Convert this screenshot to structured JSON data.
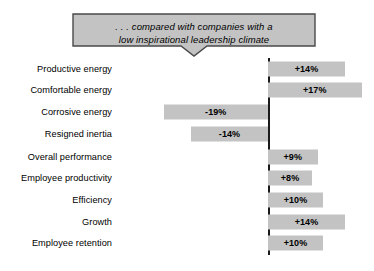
{
  "banner": {
    "line1": ". . . compared with companies with a",
    "line2": "low inspirational leadership climate"
  },
  "colors": {
    "bar_fill": "#c3c3c3",
    "banner_fill": "#c3c3c3",
    "banner_stroke": "#4a4a4a",
    "axis": "#1a1a1a",
    "text": "#000000",
    "background": "#ffffff"
  },
  "chart_data": {
    "type": "bar",
    "orientation": "horizontal",
    "title": ". . . compared with companies with a low inspirational leadership climate",
    "xlabel": "",
    "ylabel": "",
    "unit": "%",
    "zero_line": true,
    "grid": false,
    "legend": false,
    "xlim": [
      -20,
      18
    ],
    "categories": [
      "Productive energy",
      "Comfortable energy",
      "Corrosive energy",
      "Resigned inertia",
      "Overall performance",
      "Employee productivity",
      "Efficiency",
      "Growth",
      "Employee retention"
    ],
    "values": [
      14,
      17,
      -19,
      -14,
      9,
      8,
      10,
      14,
      10
    ],
    "labels": [
      "+14%",
      "+17%",
      "-19%",
      "-14%",
      "+9%",
      "+8%",
      "+10%",
      "+14%",
      "+10%"
    ]
  }
}
